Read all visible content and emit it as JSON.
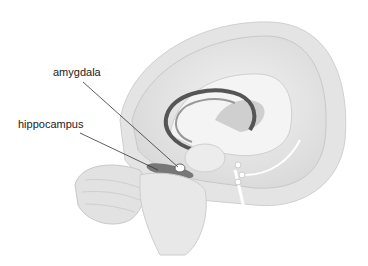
{
  "figure": {
    "labels": [
      {
        "text": "amygdala",
        "x": 53,
        "y": 73
      },
      {
        "text": "hippocampus",
        "x": 18,
        "y": 125
      }
    ]
  }
}
